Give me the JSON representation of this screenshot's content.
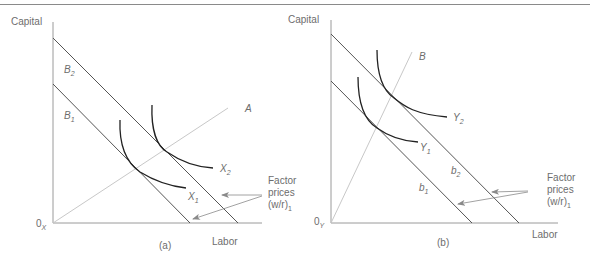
{
  "figure": {
    "panels": [
      {
        "id": "a",
        "caption": "(a)",
        "y_axis_label": "Capital",
        "x_axis_label": "Labor",
        "origin_label": "0",
        "origin_sub": "X",
        "ray_label": "A",
        "budget_lines": [
          {
            "label": "B",
            "sub": "2"
          },
          {
            "label": "B",
            "sub": "1"
          }
        ],
        "isoquants": [
          {
            "label": "X",
            "sub": "2"
          },
          {
            "label": "X",
            "sub": "1"
          }
        ],
        "annotation": {
          "line1": "Factor",
          "line2": "prices",
          "line3": "(w/r)",
          "sub": "1"
        }
      },
      {
        "id": "b",
        "caption": "(b)",
        "y_axis_label": "Capital",
        "x_axis_label": "Labor",
        "origin_label": "0",
        "origin_sub": "Y",
        "ray_label": "B",
        "budget_lines": [
          {
            "label": "b",
            "sub": "2"
          },
          {
            "label": "b",
            "sub": "1"
          }
        ],
        "isoquants": [
          {
            "label": "Y",
            "sub": "2"
          },
          {
            "label": "Y",
            "sub": "1"
          }
        ],
        "annotation": {
          "line1": "Factor",
          "line2": "prices",
          "line3": "(w/r)",
          "sub": "1"
        }
      }
    ],
    "colors": {
      "axis": "#9a9a9a",
      "budget_line": "#555555",
      "ray": "#c8c8c8",
      "isoquant": "#222222",
      "text": "#6d6d6d",
      "arrow": "#8a8a8a"
    }
  }
}
